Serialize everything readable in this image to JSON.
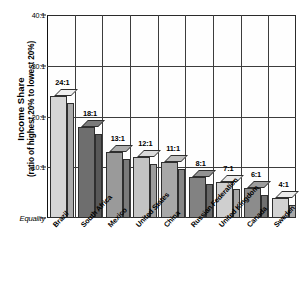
{
  "chart_data": {
    "type": "bar",
    "title": "",
    "subtitle": "",
    "xlabel": "",
    "ylabel": "Income Share (ratio of highest 20% to lowest 20%)",
    "ylabel_line1": "Income Share",
    "ylabel_line2": "(ratio of highest 20% to lowest 20%)",
    "categories": [
      "Brazil",
      "South Africa",
      "Mexico",
      "United States",
      "China",
      "Russian Federation",
      "United Kingdom",
      "Canada",
      "Sweden"
    ],
    "values": [
      24,
      18,
      13,
      12,
      11,
      8,
      7,
      6,
      4
    ],
    "value_labels": [
      "24:1",
      "18:1",
      "13:1",
      "12:1",
      "11:1",
      "8:1",
      "7:1",
      "6:1",
      "4:1"
    ],
    "bar_colors": [
      "#d6d6d6",
      "#6e6e6e",
      "#9a9a9a",
      "#c3c3c3",
      "#a8a8a8",
      "#828282",
      "#cfcfcf",
      "#8c8c8c",
      "#d2d2d2"
    ],
    "ylim": [
      0,
      40
    ],
    "ytick_values": [
      0,
      10,
      20,
      30,
      40
    ],
    "ytick_labels": [
      "Equality",
      "10:1",
      "20:1",
      "30:1",
      "40:1"
    ],
    "grid": true,
    "grid_vertical": true,
    "legend": false,
    "legend_position": "none",
    "style_3d": true,
    "axis_color": "#2b2b2b",
    "grid_color": "#3d3d3d",
    "background": "#ffffff"
  }
}
